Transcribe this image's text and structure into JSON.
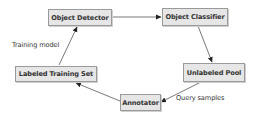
{
  "diagram": {
    "type": "flow-cycle",
    "colors": {
      "node_fill": "#e6e6e6",
      "node_border": "#9a9a9a",
      "text": "#333333",
      "edge": "#555555"
    },
    "nodes": [
      {
        "id": "detector",
        "label": "Object Detector"
      },
      {
        "id": "classifier",
        "label": "Object Classifier"
      },
      {
        "id": "pool",
        "label": "Unlabeled Pool"
      },
      {
        "id": "annotator",
        "label": "Annotator"
      },
      {
        "id": "training_set",
        "label": "Labeled Training Set"
      }
    ],
    "edges": [
      {
        "from": "detector",
        "to": "classifier",
        "label": ""
      },
      {
        "from": "classifier",
        "to": "pool",
        "label": ""
      },
      {
        "from": "pool",
        "to": "annotator",
        "label": "Query samples"
      },
      {
        "from": "annotator",
        "to": "training_set",
        "label": ""
      },
      {
        "from": "training_set",
        "to": "detector",
        "label": "Training model"
      }
    ]
  }
}
